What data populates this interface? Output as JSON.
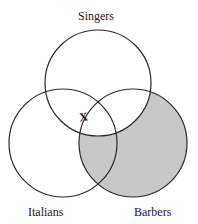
{
  "diagram": {
    "type": "venn",
    "sets": [
      {
        "id": "singers",
        "label": "Singers",
        "cx": 98,
        "cy": 83,
        "r": 53
      },
      {
        "id": "italians",
        "label": "Italians",
        "cx": 63,
        "cy": 143,
        "r": 54
      },
      {
        "id": "barbers",
        "label": "Barbers",
        "cx": 133,
        "cy": 143,
        "r": 54
      }
    ],
    "shaded_region": "Barbers minus Singers",
    "shade_color": "#c8c8c8",
    "stroke_color": "#2a2a2a",
    "mark": {
      "text": "X",
      "location": "on Italians boundary inside Singers, near Singers∩Italians∩Barbers edge",
      "x": 83,
      "y": 116
    }
  },
  "labels": {
    "singers": "Singers",
    "italians": "Italians",
    "barbers": "Barbers",
    "mark": "X"
  }
}
